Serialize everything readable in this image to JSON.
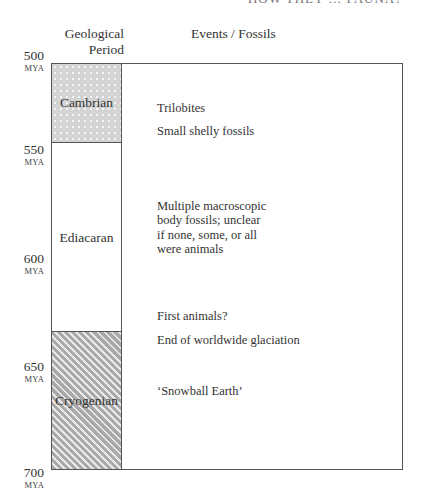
{
  "running_header": "HOW THEY … FAUNA?",
  "headers": {
    "period": "Geological Period",
    "period_line1": "Geological",
    "period_line2": "Period",
    "events": "Events / Fossils"
  },
  "axis": {
    "unit": "MYA",
    "ticks": [
      {
        "value": "500",
        "unit": "MYA"
      },
      {
        "value": "550",
        "unit": "MYA"
      },
      {
        "value": "600",
        "unit": "MYA"
      },
      {
        "value": "650",
        "unit": "MYA"
      },
      {
        "value": "700",
        "unit": "MYA"
      }
    ]
  },
  "periods": [
    {
      "name": "Cambrian",
      "fill": "dotted"
    },
    {
      "name": "Ediacaran",
      "fill": "white"
    },
    {
      "name": "Cryogenian",
      "fill": "hatched"
    }
  ],
  "events": [
    {
      "text": "Trilobites"
    },
    {
      "text": "Small shelly fossils"
    },
    {
      "lines": [
        "Multiple macroscopic",
        "body fossils; unclear",
        "if none, some, or all",
        "were animals"
      ]
    },
    {
      "text": "First animals?"
    },
    {
      "text": "End of worldwide glaciation"
    },
    {
      "text": "‘Snowball Earth’"
    }
  ]
}
